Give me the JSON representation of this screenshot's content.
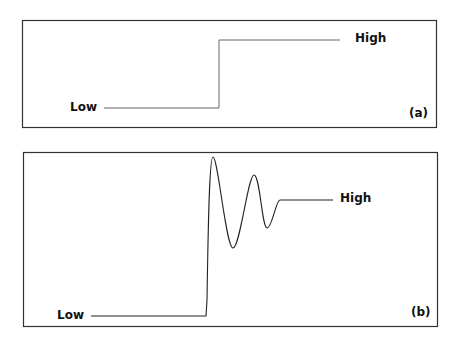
{
  "panel_a": {
    "label_low": "Low",
    "label_high": "High",
    "caption": "(a)",
    "waveform": "ideal-step"
  },
  "panel_b": {
    "label_low": "Low",
    "label_high": "High",
    "caption": "(b)",
    "waveform": "step-with-ringing"
  },
  "colors": {
    "line": "#555555",
    "border": "#333333",
    "text": "#111111"
  }
}
